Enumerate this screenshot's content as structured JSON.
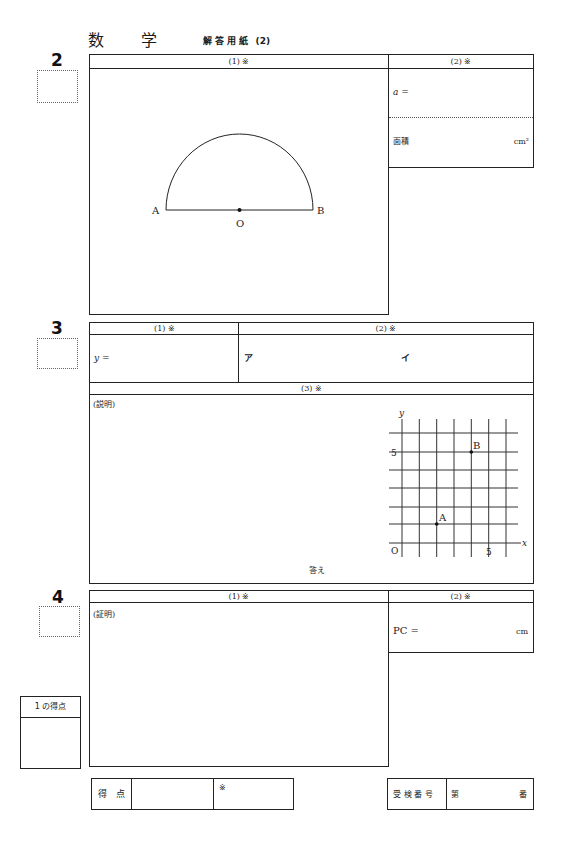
{
  "title": {
    "subject_char1": "数",
    "subject_char2": "学",
    "sheet": "解 答 用 紙",
    "sheet_number": "(2)"
  },
  "q2": {
    "number": "2",
    "part1_header": "(1) ※",
    "part2_header": "(2) ※",
    "a_label": "a =",
    "area_label": "面積",
    "area_unit": "cm²",
    "figure": {
      "point_a": "A",
      "point_b": "B",
      "point_o": "O"
    }
  },
  "q3": {
    "number": "3",
    "part1_header": "(1) ※",
    "part2_header": "(2) ※",
    "part3_header": "(3) ※",
    "y_label": "y =",
    "blank_a": "ア",
    "blank_i": "イ",
    "explanation_label": "(説明)",
    "answer_label": "答え",
    "graph": {
      "x_axis": "x",
      "y_axis": "y",
      "origin": "O",
      "x_tick": "5",
      "y_tick": "5",
      "point_a": {
        "label": "A",
        "x": 2,
        "y": 1
      },
      "point_b": {
        "label": "B",
        "x": 4,
        "y": 5
      }
    }
  },
  "q4": {
    "number": "4",
    "part1_header": "(1) ※",
    "part2_header": "(2) ※",
    "proof_label": "(証明)",
    "pc_label": "PC =",
    "pc_unit": "cm"
  },
  "score_box_1": {
    "label": "1 の得点"
  },
  "footer": {
    "score_label": "得　点",
    "mark": "※",
    "exam_number_label": "受 検 番 号",
    "dai": "第",
    "ban": "番"
  }
}
